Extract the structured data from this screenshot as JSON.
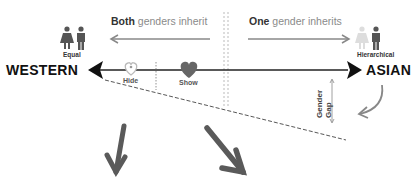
{
  "diagram": {
    "top_left": {
      "bold": "Both",
      "rest": " genders inherit"
    },
    "top_right": {
      "bold": "One",
      "rest": " gender inherits"
    },
    "left_icon_label": "Equal",
    "right_icon_label": "Hierarchical",
    "left_pole": "WESTERN",
    "right_pole": "ASIAN",
    "markers": [
      {
        "label": "Hide",
        "icon": "heart-outline-icon"
      },
      {
        "label": "Show",
        "icon": "heart-filled-icon"
      }
    ],
    "gap_label_line1": "Gender",
    "gap_label_line2": "Gap",
    "colors": {
      "axis": "#222222",
      "arrow_gray": "#666666",
      "light_gray": "#cccccc",
      "heart": "#666666"
    }
  }
}
